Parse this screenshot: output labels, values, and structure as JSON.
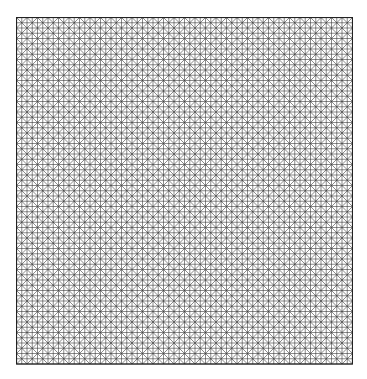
{
  "diagram": {
    "type": "triangulated-square-grid",
    "columns": 32,
    "rows": 33,
    "cell_size": 10.5,
    "origin": [
      16,
      17
    ],
    "line_color": "#3a3a3a",
    "border_color": "#222222",
    "background": "#ffffff",
    "cell_pattern": [
      "border",
      "both-diagonals",
      "vertical-midline",
      "horizontal-midline"
    ]
  }
}
